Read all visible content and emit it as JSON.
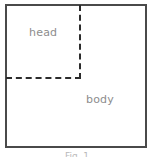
{
  "figure": {
    "type": "schematic-box-partition",
    "background_color": "#ffffff",
    "border_color": "#4a4a4a",
    "divider_color": "#2b2b2b",
    "label_color": "#8d8d8d",
    "regions": [
      {
        "id": "head",
        "label": "head",
        "position": "upper-left",
        "bounded_by": "dashed-divider"
      },
      {
        "id": "body",
        "label": "body",
        "position": "lower-right",
        "bounded_by": "solid-outer-border"
      }
    ],
    "dividers": [
      {
        "id": "divider-vertical",
        "orientation": "vertical",
        "style": "dashed"
      },
      {
        "id": "divider-horizontal",
        "orientation": "horizontal",
        "style": "dashed"
      }
    ],
    "caption": "Fig. 1"
  }
}
